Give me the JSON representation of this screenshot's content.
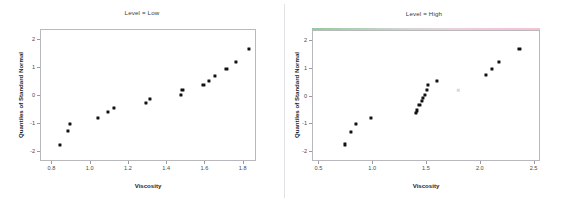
{
  "figure": {
    "background_color": "#ffffff",
    "marker_color": "#111114",
    "axis_color": "#b9b9bd",
    "divider_color": "#e2e2e6"
  },
  "panels": [
    {
      "id": "low",
      "title": "Level = Low",
      "xlabel": "Viscosity",
      "ylabel": "Quantiles of Standard Normal",
      "xticks": [
        "0.8",
        "1.0",
        "1.2",
        "1.4",
        "1.6",
        "1.8"
      ],
      "yticks": [
        "-2",
        "-1",
        "0",
        "1",
        "2"
      ],
      "strip_gradient": false
    },
    {
      "id": "high",
      "title": "Level = High",
      "xlabel": "Viscosity",
      "ylabel": "Quantiles of Standard Normal",
      "xticks": [
        "0.5",
        "1.0",
        "1.5",
        "2.0",
        "2.5"
      ],
      "yticks": [
        "-2",
        "-1",
        "0",
        "1",
        "2"
      ],
      "strip_gradient": true,
      "strip_gradient_start": "#8fc79a",
      "strip_gradient_end": "#f6bed1"
    }
  ],
  "chart_data": [
    {
      "type": "scatter",
      "panel": "Level = Low",
      "title": "Level = Low",
      "xlabel": "Viscosity",
      "ylabel": "Quantiles of Standard Normal",
      "xlim": [
        0.74,
        1.87
      ],
      "ylim": [
        -2.35,
        2.35
      ],
      "xticks": [
        0.8,
        1.0,
        1.2,
        1.4,
        1.6,
        1.8
      ],
      "yticks": [
        -2,
        -1,
        0,
        1,
        2
      ],
      "grid": false,
      "legend": false,
      "points": [
        {
          "x": 0.84,
          "y": -1.73
        },
        {
          "x": 0.88,
          "y": -1.25
        },
        {
          "x": 0.89,
          "y": -0.99
        },
        {
          "x": 1.04,
          "y": -0.77
        },
        {
          "x": 1.09,
          "y": -0.57
        },
        {
          "x": 1.12,
          "y": -0.41
        },
        {
          "x": 1.29,
          "y": -0.25
        },
        {
          "x": 1.31,
          "y": -0.09
        },
        {
          "x": 1.47,
          "y": 0.04
        },
        {
          "x": 1.48,
          "y": 0.21
        },
        {
          "x": 1.59,
          "y": 0.38
        },
        {
          "x": 1.62,
          "y": 0.55
        },
        {
          "x": 1.65,
          "y": 0.73
        },
        {
          "x": 1.71,
          "y": 0.95
        },
        {
          "x": 1.76,
          "y": 1.22
        },
        {
          "x": 1.83,
          "y": 1.68
        }
      ]
    },
    {
      "type": "scatter",
      "panel": "Level = High",
      "title": "Level = High",
      "xlabel": "Viscosity",
      "ylabel": "Quantiles of Standard Normal",
      "xlim": [
        0.44,
        2.56
      ],
      "ylim": [
        -2.35,
        2.35
      ],
      "xticks": [
        0.5,
        1.0,
        1.5,
        2.0,
        2.5
      ],
      "yticks": [
        -2,
        -1,
        0,
        1,
        2
      ],
      "grid": false,
      "legend": false,
      "points": [
        {
          "x": 0.74,
          "y": -1.72
        },
        {
          "x": 0.79,
          "y": -1.26
        },
        {
          "x": 0.84,
          "y": -0.99
        },
        {
          "x": 0.98,
          "y": -0.78
        },
        {
          "x": 1.4,
          "y": -0.58
        },
        {
          "x": 1.41,
          "y": -0.5
        },
        {
          "x": 1.43,
          "y": -0.3
        },
        {
          "x": 1.45,
          "y": -0.16
        },
        {
          "x": 1.46,
          "y": -0.05
        },
        {
          "x": 1.48,
          "y": 0.05
        },
        {
          "x": 1.5,
          "y": 0.24
        },
        {
          "x": 1.51,
          "y": 0.4
        },
        {
          "x": 1.59,
          "y": 0.57
        },
        {
          "x": 2.05,
          "y": 0.76
        },
        {
          "x": 2.1,
          "y": 0.98
        },
        {
          "x": 2.17,
          "y": 1.25
        },
        {
          "x": 2.36,
          "y": 1.71
        }
      ],
      "faint_points": [
        {
          "x": 1.79,
          "y": 0.22
        }
      ]
    }
  ]
}
